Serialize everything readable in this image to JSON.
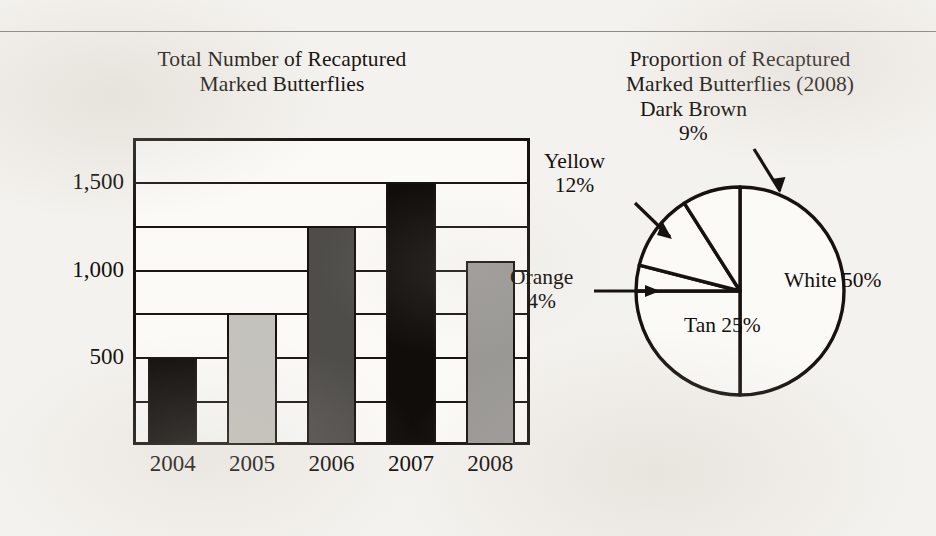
{
  "page": {
    "background_color": "#f4f2ee",
    "ink_color": "#14100d",
    "rule_color": "#8e8a84"
  },
  "bar_chart": {
    "title_line1": "Total Number of Recaptured",
    "title_line2": "Marked Butterflies"
  },
  "pie_chart": {
    "title_line1": "Proportion of Recaptured",
    "title_line2": "Marked Butterflies (2008)"
  },
  "chart_data": [
    {
      "type": "bar",
      "title": "Total Number of Recaptured Marked Butterflies",
      "xlabel": "",
      "ylabel": "",
      "categories": [
        "2004",
        "2005",
        "2006",
        "2007",
        "2008"
      ],
      "values": [
        500,
        750,
        1250,
        1500,
        1050
      ],
      "ylim": [
        0,
        1750
      ],
      "yticks": [
        500,
        1000,
        1500
      ],
      "ytick_labels": [
        "500",
        "1,000",
        "1,500"
      ],
      "gridlines": [
        250,
        500,
        750,
        1000,
        1250,
        1500
      ],
      "grid": true,
      "legend": "none",
      "bar_colors": [
        "#100d0b",
        "#c4c2bd",
        "#4f4d4a",
        "#100d0b",
        "#9a9895"
      ],
      "bar_edge_color": "#17120f"
    },
    {
      "type": "pie",
      "title": "Proportion of Recaptured Marked Butterflies (2008)",
      "labels": [
        "White",
        "Tan",
        "Orange",
        "Yellow",
        "Dark Brown"
      ],
      "values": [
        50,
        25,
        4,
        12,
        9
      ],
      "value_labels": [
        "50%",
        "25%",
        "4%",
        "12%",
        "9%"
      ],
      "slice_fill": "#fbfaf7",
      "slice_edge_color": "#17120f",
      "start_angle_deg": 90,
      "direction": "clockwise",
      "legend": "none",
      "annotations": [
        {
          "label": "White",
          "value": "50%",
          "placement": "inside-right"
        },
        {
          "label": "Tan",
          "value": "25%",
          "placement": "inside-bottom-left"
        },
        {
          "label": "Orange",
          "value": "4%",
          "placement": "callout-left-arrow"
        },
        {
          "label": "Yellow",
          "value": "12%",
          "placement": "callout-upper-left-arrow"
        },
        {
          "label": "Dark Brown",
          "value": "9%",
          "placement": "callout-top-arrow"
        }
      ]
    }
  ]
}
